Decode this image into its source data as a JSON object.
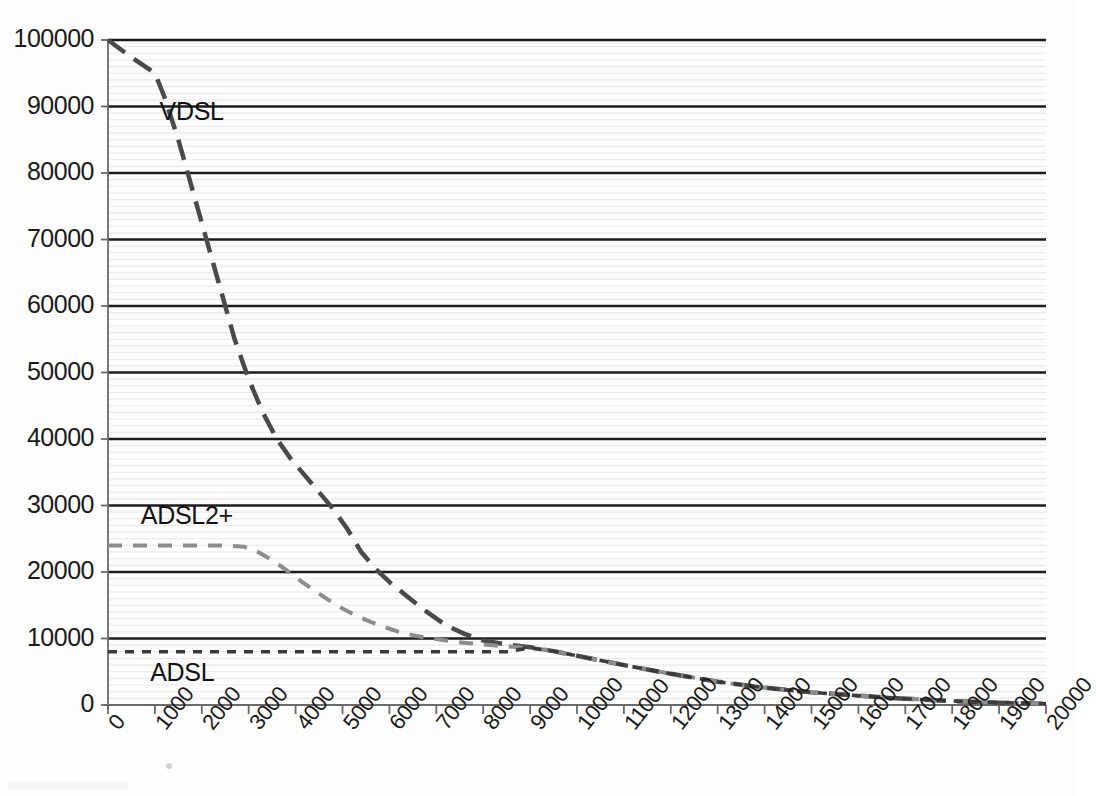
{
  "chart_data": {
    "type": "line",
    "title": "",
    "subtitle": "",
    "xlabel": "",
    "ylabel": "",
    "xlim": [
      0,
      20000
    ],
    "ylim": [
      0,
      100000
    ],
    "grid": true,
    "legend_position": "inline-annotation",
    "x_ticks": [
      0,
      1000,
      2000,
      3000,
      4000,
      5000,
      6000,
      7000,
      8000,
      9000,
      10000,
      11000,
      12000,
      13000,
      14000,
      15000,
      16000,
      17000,
      18000,
      19000,
      20000
    ],
    "x_tick_labels": [
      "0",
      "1000",
      "2000",
      "3000",
      "4000",
      "5000",
      "6000",
      "7000",
      "8000",
      "9000",
      "10000",
      "11000",
      "12000",
      "13000",
      "14000",
      "15000",
      "16000",
      "17000",
      "18000",
      "19000",
      "20000"
    ],
    "y_ticks": [
      0,
      10000,
      20000,
      30000,
      40000,
      50000,
      60000,
      70000,
      80000,
      90000,
      100000
    ],
    "y_tick_labels": [
      "0",
      "10000",
      "20000",
      "30000",
      "40000",
      "50000",
      "60000",
      "70000",
      "80000",
      "90000",
      "100000"
    ],
    "series": [
      {
        "name": "VDSL",
        "label": "VDSL",
        "color": "#4a4a4a",
        "line_style": "long-dash",
        "line_width": 4.5,
        "dash_pattern": "21,11",
        "label_x": 1100,
        "label_y": 89000,
        "x": [
          0,
          500,
          1000,
          1200,
          1500,
          1800,
          2100,
          2400,
          2700,
          3000,
          3300,
          3600,
          3900,
          4200,
          4500,
          4800,
          5100,
          5400,
          5700,
          6000,
          6400,
          6800,
          7200,
          7600,
          8000,
          8500,
          9000,
          9500,
          10000,
          11000,
          12000,
          13000,
          14000,
          15000,
          16000,
          17000,
          18000,
          19000,
          20000
        ],
        "y": [
          100000,
          97400,
          95000,
          91500,
          85000,
          77500,
          70000,
          62500,
          55000,
          49000,
          44000,
          40000,
          37000,
          34500,
          32000,
          29500,
          26500,
          23000,
          20500,
          18500,
          16200,
          14000,
          12000,
          10700,
          9700,
          9100,
          8700,
          8100,
          7400,
          6000,
          4700,
          3500,
          2600,
          1900,
          1400,
          950,
          600,
          350,
          180
        ]
      },
      {
        "name": "ADSL2+",
        "label": "ADSL2+",
        "color": "#8d8d8d",
        "line_style": "dash",
        "line_width": 4,
        "dash_pattern": "14,11",
        "label_x": 700,
        "label_y": 28200,
        "x": [
          0,
          500,
          1000,
          1500,
          2000,
          2500,
          2900,
          3200,
          3500,
          3800,
          4100,
          4400,
          4700,
          5000,
          5300,
          5600,
          5900,
          6200,
          6500,
          6800,
          7100,
          7400,
          7700,
          8000,
          8500,
          9000,
          9500,
          10000,
          11000,
          12000,
          13000,
          14000,
          15000,
          16000,
          17000,
          18000,
          19000,
          20000
        ],
        "y": [
          24000,
          24000,
          24000,
          24000,
          24000,
          24000,
          23800,
          23000,
          21800,
          20300,
          18700,
          17200,
          15800,
          14500,
          13400,
          12500,
          11700,
          11000,
          10500,
          10100,
          9800,
          9500,
          9300,
          9100,
          8800,
          8600,
          8100,
          7400,
          6000,
          4700,
          3500,
          2600,
          1900,
          1400,
          950,
          600,
          350,
          180
        ]
      },
      {
        "name": "ADSL",
        "label": "ADSL",
        "color": "#3a3a3a",
        "line_style": "short-dash",
        "line_width": 3.5,
        "dash_pattern": "9,8",
        "label_x": 900,
        "label_y": 4600,
        "x": [
          0,
          1000,
          2000,
          3000,
          4000,
          5000,
          6000,
          7000,
          7500,
          8000,
          8500,
          9000,
          9500,
          10000,
          11000,
          12000,
          13000,
          14000,
          15000,
          16000,
          17000,
          18000,
          19000,
          20000
        ],
        "y": [
          8000,
          8000,
          8000,
          8000,
          8000,
          8000,
          8000,
          8000,
          8000,
          8000,
          8000,
          8600,
          8100,
          7400,
          6000,
          4700,
          3500,
          2600,
          1900,
          1400,
          950,
          600,
          350,
          180
        ]
      }
    ]
  },
  "axes": {
    "axis_color": "#6a6a6a",
    "major_grid_color": "#1c1c1c",
    "minor_grid_color": "#e9e9ec",
    "plot_left": 108,
    "plot_right": 1046,
    "plot_top": 40,
    "plot_bottom": 705
  }
}
